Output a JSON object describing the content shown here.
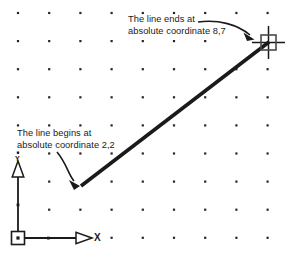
{
  "diagram": {
    "background_color": "#ffffff",
    "ink_color": "#1a1a1a",
    "grid": {
      "dot_color": "#262626",
      "origin_x": 18,
      "origin_y": 13,
      "spacing_x": 31.2,
      "spacing_y": 28.1,
      "columns": 9,
      "rows": 9,
      "dot_size": 2.2
    },
    "annotations": [
      {
        "name": "end-annotation",
        "line1": "The line ends at",
        "line2": "absolute coordinate 8,7"
      },
      {
        "name": "start-annotation",
        "line1": "The line begins at",
        "line2": "absolute coordinate 2,2"
      }
    ],
    "ucs_icon": {
      "x_axis_label": "X",
      "y_axis_label": "Y",
      "origin_marker": "square-with-dot"
    },
    "line_object": {
      "start_point_label": "2,2",
      "end_point_label": "8,7",
      "start_px": [
        81,
        186
      ],
      "end_px": [
        268,
        43
      ],
      "stroke_width": 3.4
    },
    "cursor": {
      "type": "crosshair-pickbox",
      "x": 268,
      "y": 43
    }
  }
}
